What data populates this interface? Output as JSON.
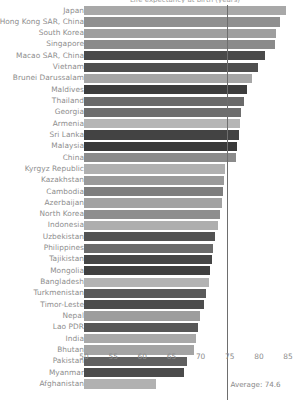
{
  "chart_data": {
    "type": "bar",
    "orientation": "horizontal",
    "title": "Life expectancy at birth (years)",
    "xlabel": "",
    "ylabel": "",
    "xlim": [
      50,
      86.5
    ],
    "xticks": [
      50,
      55,
      60,
      65,
      70,
      75,
      80,
      85
    ],
    "grid": false,
    "legend": null,
    "average": 74.6,
    "average_label": "Average: 74.6",
    "categories": [
      "Japan",
      "Hong Kong SAR, China",
      "South Korea",
      "Singapore",
      "Macao SAR, China",
      "Vietnam",
      "Brunei Darussalam",
      "Maldives",
      "Thailand",
      "Georgia",
      "Armenia",
      "Sri Lanka",
      "Malaysia",
      "China",
      "Kyrgyz Republic",
      "Kazakhstan",
      "Cambodia",
      "Azerbaijan",
      "North Korea",
      "Indonesia",
      "Uzbekistan",
      "Philippines",
      "Tajikistan",
      "Mongolia",
      "Bangladesh",
      "Turkmenistan",
      "Timor-Leste",
      "Nepal",
      "Lao PDR",
      "India",
      "Bhutan",
      "Pakistan",
      "Myanmar",
      "Afghanistan"
    ],
    "values": [
      84.6,
      83.6,
      83.0,
      82.8,
      81.0,
      79.9,
      78.9,
      78.0,
      77.4,
      76.9,
      76.7,
      76.6,
      76.2,
      76.1,
      74.2,
      74.0,
      73.8,
      73.6,
      73.3,
      73.0,
      72.5,
      72.2,
      71.9,
      71.6,
      71.4,
      70.9,
      70.6,
      69.9,
      69.5,
      69.2,
      68.8,
      67.6,
      67.2,
      62.4
    ],
    "bar_colors": [
      "#a8a8a8",
      "#8f8f8f",
      "#9e9e9e",
      "#8a8a8a",
      "#4a4a4a",
      "#4f4f4f",
      "#a6a6a6",
      "#3d3d3d",
      "#6a6a6a",
      "#6e6e6e",
      "#b5b5b5",
      "#434343",
      "#3a3a3a",
      "#8b8b8b",
      "#b0b0b0",
      "#9a9a9a",
      "#7e7e7e",
      "#a2a2a2",
      "#8e8e8e",
      "#aeaeae",
      "#525252",
      "#6b6b6b",
      "#464646",
      "#3f3f3f",
      "#b3b3b3",
      "#5a5a5a",
      "#4c4c4c",
      "#9d9d9d",
      "#575757",
      "#a9a9a9",
      "#a4a4a4",
      "#606060",
      "#4b4b4b",
      "#b1b1b1"
    ]
  }
}
